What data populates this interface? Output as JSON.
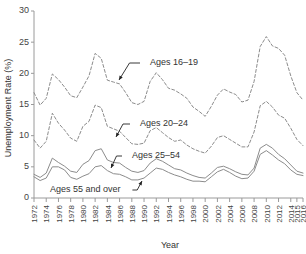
{
  "chart_data": {
    "type": "line",
    "title": "",
    "xlabel": "Year",
    "ylabel": "Unemployment Rate (%)",
    "xlim": [
      1972,
      2016
    ],
    "ylim": [
      0,
      30
    ],
    "y_ticks": [
      0,
      5,
      10,
      15,
      20,
      25,
      30
    ],
    "x_tick_labels": [
      "1972",
      "1974",
      "1976",
      "1978",
      "1980",
      "1982",
      "1984",
      "1986",
      "1988",
      "1990",
      "1992",
      "1994",
      "1996",
      "1998",
      "2000",
      "2002",
      "2004",
      "2006",
      "2008",
      "2010",
      "2012",
      "2014",
      "2015",
      "2016"
    ],
    "grid": false,
    "legend": "inline-annotations",
    "x": [
      1972,
      1973,
      1974,
      1975,
      1976,
      1977,
      1978,
      1979,
      1980,
      1981,
      1982,
      1983,
      1984,
      1985,
      1986,
      1987,
      1988,
      1989,
      1990,
      1991,
      1992,
      1993,
      1994,
      1995,
      1996,
      1997,
      1998,
      1999,
      2000,
      2001,
      2002,
      2003,
      2004,
      2005,
      2006,
      2007,
      2008,
      2009,
      2010,
      2011,
      2012,
      2013,
      2014,
      2015,
      2016
    ],
    "series": [
      {
        "name": "Ages 16-19",
        "style": "dashed",
        "values": [
          16.9,
          14.9,
          16.0,
          19.9,
          19.0,
          17.8,
          16.4,
          16.1,
          17.8,
          19.6,
          23.2,
          22.4,
          18.9,
          18.6,
          18.3,
          16.9,
          15.3,
          15.0,
          15.5,
          18.7,
          20.1,
          19.0,
          17.6,
          17.3,
          16.7,
          16.0,
          14.6,
          13.9,
          13.1,
          14.7,
          16.5,
          17.5,
          17.0,
          16.6,
          15.4,
          15.7,
          18.7,
          24.3,
          25.9,
          24.4,
          24.0,
          22.9,
          19.6,
          16.9,
          15.7
        ]
      },
      {
        "name": "Ages 20-24",
        "style": "dashed",
        "values": [
          9.3,
          8.0,
          9.1,
          13.6,
          12.0,
          10.9,
          9.6,
          9.1,
          11.5,
          12.3,
          14.9,
          14.5,
          11.5,
          11.1,
          10.7,
          9.7,
          8.7,
          8.6,
          8.8,
          10.8,
          11.3,
          10.5,
          9.7,
          9.1,
          9.3,
          8.5,
          7.9,
          7.5,
          7.2,
          8.3,
          9.7,
          10.0,
          9.4,
          8.8,
          8.2,
          8.2,
          10.6,
          14.8,
          15.5,
          14.6,
          13.3,
          12.8,
          11.2,
          9.4,
          8.4
        ]
      },
      {
        "name": "Ages 25-54",
        "style": "solid",
        "values": [
          3.8,
          3.3,
          4.0,
          6.4,
          5.7,
          5.1,
          4.3,
          4.1,
          5.4,
          6.0,
          7.6,
          7.9,
          6.1,
          5.7,
          5.6,
          4.9,
          4.3,
          4.1,
          4.4,
          5.6,
          6.3,
          5.9,
          5.3,
          4.7,
          4.5,
          4.0,
          3.6,
          3.3,
          3.2,
          4.0,
          4.9,
          5.1,
          4.7,
          4.2,
          3.8,
          3.7,
          4.8,
          8.0,
          8.6,
          8.0,
          7.0,
          6.3,
          5.3,
          4.3,
          4.0
        ]
      },
      {
        "name": "Ages 55 and over",
        "style": "solid",
        "values": [
          3.4,
          2.8,
          3.2,
          5.0,
          5.0,
          4.5,
          3.3,
          3.0,
          3.5,
          3.9,
          5.0,
          5.2,
          4.4,
          3.9,
          3.8,
          3.4,
          2.9,
          2.9,
          3.2,
          4.0,
          4.8,
          4.6,
          4.1,
          3.7,
          3.4,
          3.0,
          2.7,
          2.7,
          2.6,
          3.4,
          4.2,
          4.6,
          4.1,
          3.5,
          3.1,
          3.2,
          4.3,
          7.0,
          7.6,
          6.9,
          6.1,
          5.5,
          4.5,
          3.8,
          3.6
        ]
      }
    ],
    "annotations": [
      {
        "label": "Ages 16-19",
        "text_x": 150,
        "text_y": 63,
        "tip_x": 119,
        "tip_y": 80
      },
      {
        "label": "Ages 20-24",
        "text_x": 140,
        "text_y": 124,
        "tip_x": 116,
        "tip_y": 137
      },
      {
        "label": "Ages 25-54",
        "text_x": 132,
        "text_y": 156,
        "tip_x": 111,
        "tip_y": 168
      },
      {
        "label": "Ages 55 and over",
        "text_x": 50,
        "text_y": 190,
        "tip_x": 142,
        "tip_y": 181
      }
    ]
  }
}
